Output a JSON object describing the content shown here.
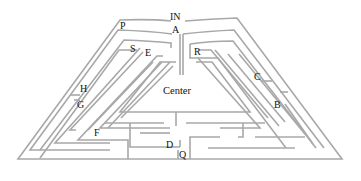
{
  "diagram": {
    "type": "maze",
    "shape": "trapezoid labyrinth",
    "wall_color": "#a8a8a8",
    "label_color": "#111111",
    "labels": {
      "entrance": "IN",
      "A": "A",
      "P": "P",
      "S": "S",
      "E": "E",
      "R": "R",
      "H": "H",
      "G": "G",
      "C": "C",
      "B": "B",
      "F": "F",
      "D": "D",
      "Q": "Q",
      "center": "Center"
    }
  }
}
